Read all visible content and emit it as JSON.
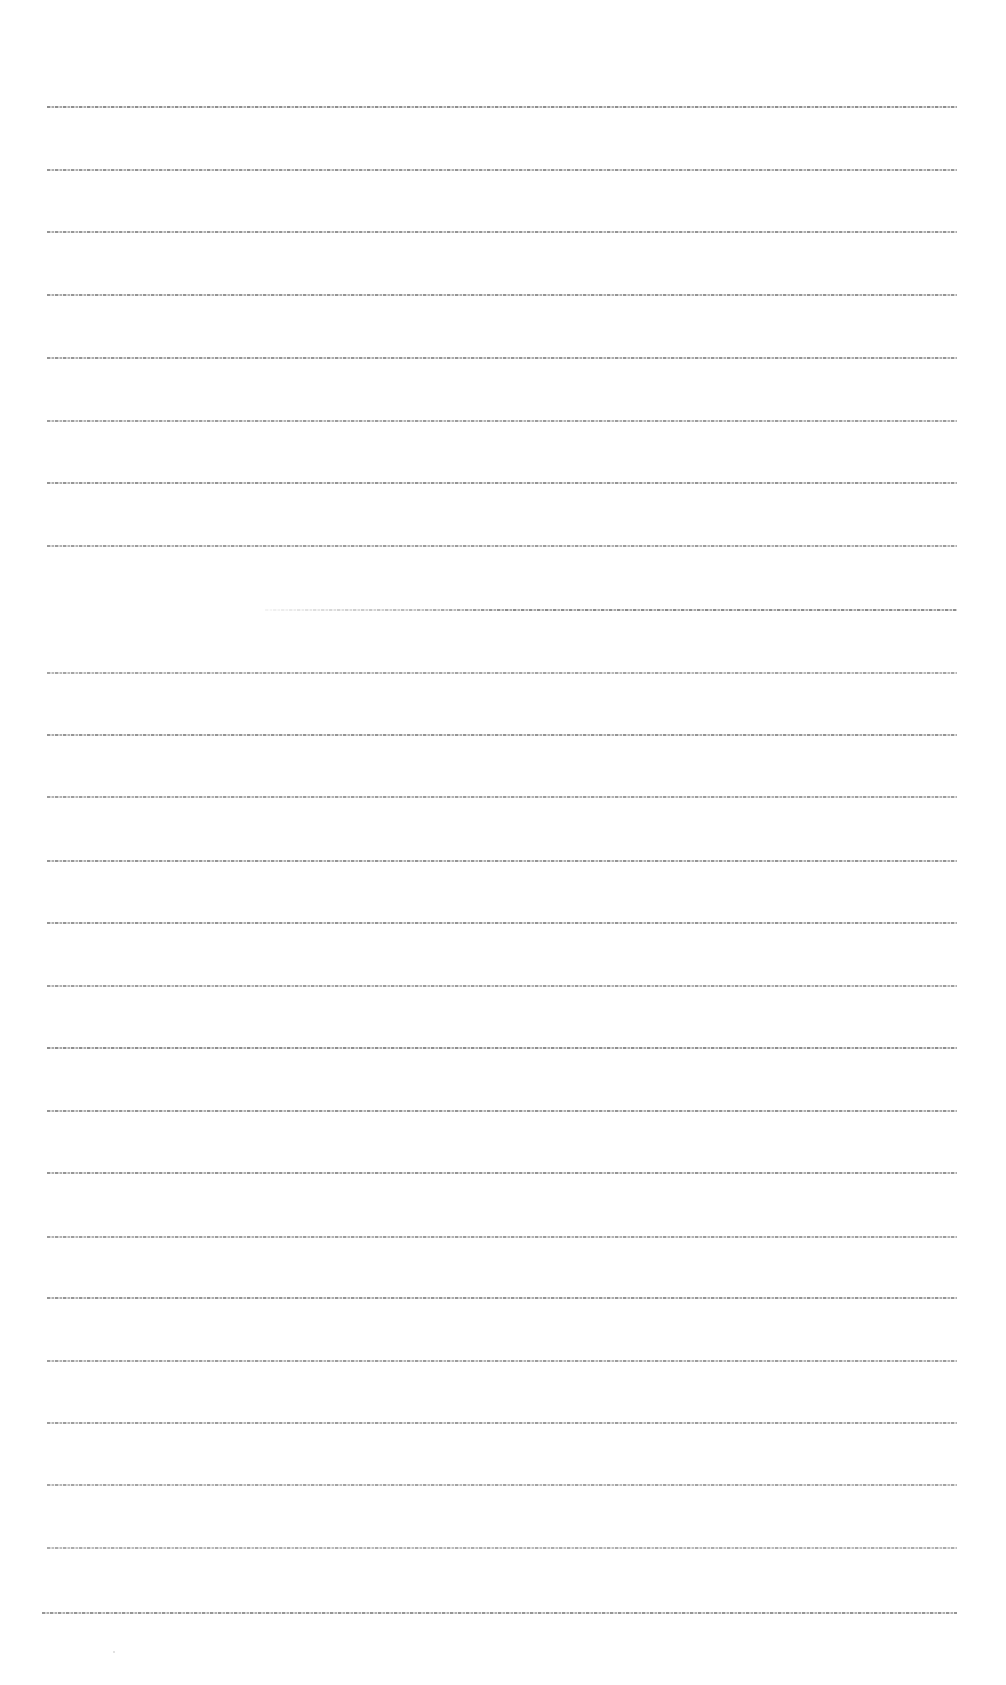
{
  "document": {
    "type": "text page (text rendered too small to be legible)",
    "lines": [
      {
        "y": 106,
        "x_start": 47,
        "x_end": 957,
        "opacity": 0.8,
        "text": ""
      },
      {
        "y": 169,
        "x_start": 47,
        "x_end": 957,
        "opacity": 0.75,
        "text": ""
      },
      {
        "y": 231,
        "x_start": 47,
        "x_end": 957,
        "opacity": 0.75,
        "text": ""
      },
      {
        "y": 294,
        "x_start": 47,
        "x_end": 957,
        "opacity": 0.75,
        "text": ""
      },
      {
        "y": 357,
        "x_start": 47,
        "x_end": 957,
        "opacity": 0.75,
        "text": ""
      },
      {
        "y": 420,
        "x_start": 47,
        "x_end": 957,
        "opacity": 0.7,
        "text": ""
      },
      {
        "y": 482,
        "x_start": 47,
        "x_end": 957,
        "opacity": 0.75,
        "text": ""
      },
      {
        "y": 545,
        "x_start": 47,
        "x_end": 957,
        "opacity": 0.7,
        "text": ""
      },
      {
        "y": 609,
        "x_start": 265,
        "x_end": 957,
        "opacity": 0.8,
        "fade_in": true,
        "text": ""
      },
      {
        "y": 672,
        "x_start": 47,
        "x_end": 957,
        "opacity": 0.65,
        "text": ""
      },
      {
        "y": 734,
        "x_start": 47,
        "x_end": 957,
        "opacity": 0.75,
        "text": ""
      },
      {
        "y": 796,
        "x_start": 47,
        "x_end": 957,
        "opacity": 0.7,
        "text": ""
      },
      {
        "y": 860,
        "x_start": 47,
        "x_end": 957,
        "opacity": 0.75,
        "text": ""
      },
      {
        "y": 922,
        "x_start": 47,
        "x_end": 957,
        "opacity": 0.75,
        "text": ""
      },
      {
        "y": 985,
        "x_start": 47,
        "x_end": 957,
        "opacity": 0.7,
        "text": ""
      },
      {
        "y": 1047,
        "x_start": 47,
        "x_end": 957,
        "opacity": 0.8,
        "text": ""
      },
      {
        "y": 1110,
        "x_start": 47,
        "x_end": 957,
        "opacity": 0.75,
        "text": ""
      },
      {
        "y": 1172,
        "x_start": 47,
        "x_end": 957,
        "opacity": 0.75,
        "text": ""
      },
      {
        "y": 1236,
        "x_start": 47,
        "x_end": 957,
        "opacity": 0.7,
        "text": ""
      },
      {
        "y": 1297,
        "x_start": 47,
        "x_end": 957,
        "opacity": 0.75,
        "text": ""
      },
      {
        "y": 1360,
        "x_start": 47,
        "x_end": 957,
        "opacity": 0.7,
        "text": ""
      },
      {
        "y": 1422,
        "x_start": 47,
        "x_end": 957,
        "opacity": 0.7,
        "text": ""
      },
      {
        "y": 1484,
        "x_start": 47,
        "x_end": 957,
        "opacity": 0.65,
        "text": ""
      },
      {
        "y": 1547,
        "x_start": 47,
        "x_end": 957,
        "opacity": 0.6,
        "text": ""
      },
      {
        "y": 1612,
        "x_start": 42,
        "x_end": 957,
        "opacity": 0.75,
        "text": ""
      }
    ],
    "marks": [
      {
        "x": 113,
        "y": 1651
      }
    ]
  },
  "colors": {
    "background": "#ffffff",
    "text_line": "#6e6e6e"
  }
}
